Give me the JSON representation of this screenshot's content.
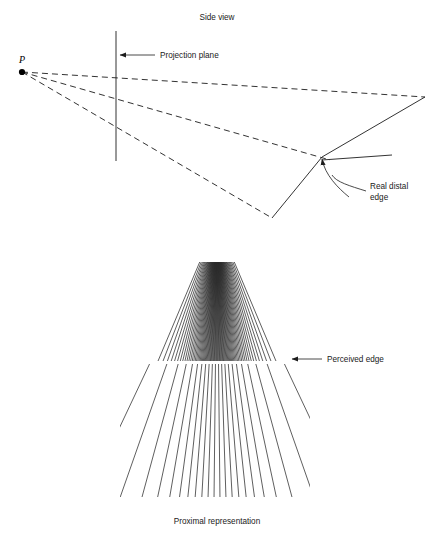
{
  "figure": {
    "width": 435,
    "height": 537,
    "background": "#ffffff",
    "ink": "#1c1c1c"
  },
  "panels": {
    "top": {
      "title": "Side view",
      "title_pos": {
        "x": 217,
        "y": 20
      },
      "viewpoint": {
        "label": "P",
        "label_pos": {
          "x": 12,
          "y": 63
        },
        "dot": {
          "x": 22,
          "y": 72,
          "r": 3.1
        }
      },
      "projection_plane": {
        "label": "Projection plane",
        "label_pos": {
          "x": 160,
          "y": 32
        },
        "line": {
          "x1": 116,
          "y1": 31,
          "x2": 116,
          "y2": 161
        },
        "arrow": {
          "x1": 155,
          "y1": 55,
          "x2": 120,
          "y2": 55
        }
      },
      "real_distal_edge": {
        "label_line1": "Real distal",
        "label_line2": "edge",
        "label_pos": {
          "x": 370,
          "y": 189
        },
        "arrow_tip": {
          "x": 322,
          "y": 155
        },
        "leader_curve": "M 366 191 C 350 186 336 182 332 175"
      },
      "rays": [
        {
          "name": "ray-upper",
          "x1": 22,
          "y1": 72,
          "x2": 425,
          "y2": 97
        },
        {
          "name": "ray-middle",
          "x1": 22,
          "y1": 72,
          "x2": 330,
          "y2": 160
        },
        {
          "name": "ray-lower",
          "x1": 22,
          "y1": 72,
          "x2": 272,
          "y2": 218
        }
      ],
      "edge_lines": [
        {
          "name": "distal-edge-far",
          "x1": 425,
          "y1": 97,
          "x2": 322,
          "y2": 157
        },
        {
          "name": "distal-edge-near",
          "x1": 322,
          "y1": 157,
          "x2": 272,
          "y2": 218
        },
        {
          "name": "distal-edge-right",
          "x1": 322,
          "y1": 160,
          "x2": 392,
          "y2": 155
        }
      ]
    },
    "bottom": {
      "caption": "Proximal representation",
      "caption_pos": {
        "x": 217,
        "y": 524
      },
      "perceived_edge": {
        "label": "Perceived edge",
        "label_pos": {
          "x": 327,
          "y": 362
        },
        "arrow": {
          "x1": 322,
          "y1": 359,
          "x2": 292,
          "y2": 359
        }
      },
      "fan": {
        "apex": {
          "x": 217,
          "y": 221
        },
        "left": 140,
        "right": 290,
        "edge_y": 361,
        "bottom_y": 497,
        "dense_count": 75,
        "sparse_count": 21,
        "dense_top_y": 262,
        "dense_spread_half": 0.5,
        "sparse_spread_half": 1.0
      }
    }
  }
}
